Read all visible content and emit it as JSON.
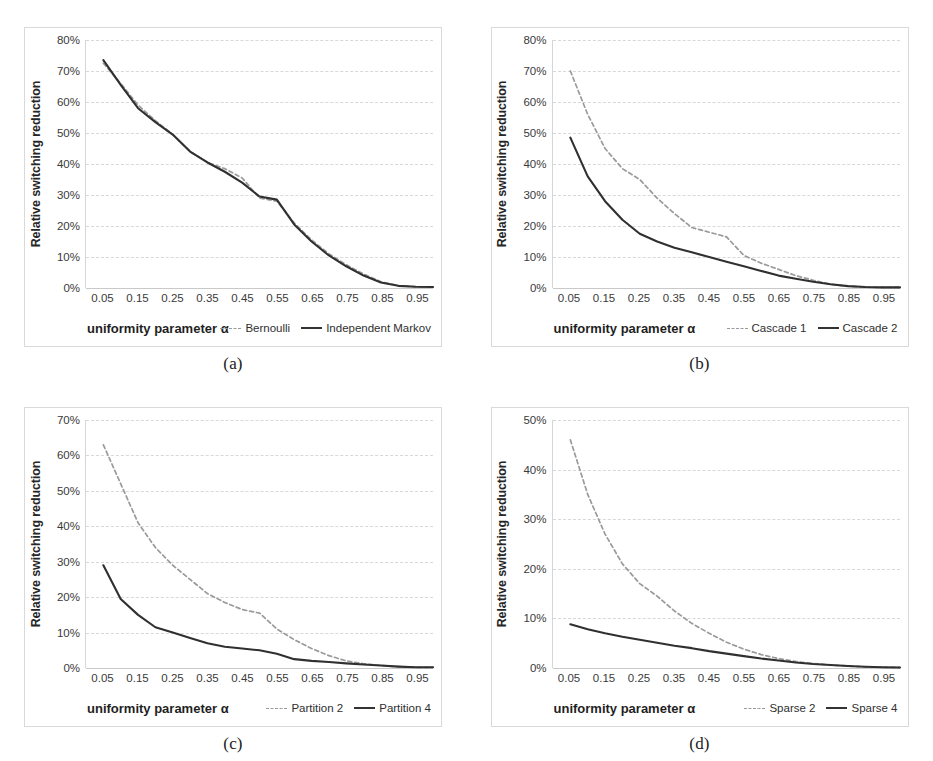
{
  "figure": {
    "panels": [
      {
        "caption": "(a)",
        "xlabel": "uniformity parameter α",
        "ylabel": "Relative switching reduction",
        "yticks": [
          "0%",
          "10%",
          "20%",
          "30%",
          "40%",
          "50%",
          "60%",
          "70%",
          "80%"
        ],
        "xticks": [
          "0.05",
          "0.15",
          "0.25",
          "0.35",
          "0.45",
          "0.55",
          "0.65",
          "0.75",
          "0.85",
          "0.95"
        ],
        "legend": [
          {
            "label": "Bernoulli",
            "style": "dashed"
          },
          {
            "label": "Independent Markov",
            "style": "solid"
          }
        ]
      },
      {
        "caption": "(b)",
        "xlabel": "uniformity parameter α",
        "ylabel": "Relative switching reduction",
        "yticks": [
          "0%",
          "10%",
          "20%",
          "30%",
          "40%",
          "50%",
          "60%",
          "70%",
          "80%"
        ],
        "xticks": [
          "0.05",
          "0.15",
          "0.25",
          "0.35",
          "0.45",
          "0.55",
          "0.65",
          "0.75",
          "0.85",
          "0.95"
        ],
        "legend": [
          {
            "label": "Cascade 1",
            "style": "dashed"
          },
          {
            "label": "Cascade 2",
            "style": "solid"
          }
        ]
      },
      {
        "caption": "(c)",
        "xlabel": "uniformity parameter α",
        "ylabel": "Relative switching reduction",
        "yticks": [
          "0%",
          "10%",
          "20%",
          "30%",
          "40%",
          "50%",
          "60%",
          "70%"
        ],
        "xticks": [
          "0.05",
          "0.15",
          "0.25",
          "0.35",
          "0.45",
          "0.55",
          "0.65",
          "0.75",
          "0.85",
          "0.95"
        ],
        "legend": [
          {
            "label": "Partition 2",
            "style": "dashed"
          },
          {
            "label": "Partition 4",
            "style": "solid"
          }
        ]
      },
      {
        "caption": "(d)",
        "xlabel": "uniformity parameter α",
        "ylabel": "Relative switching reduction",
        "yticks": [
          "0%",
          "10%",
          "20%",
          "30%",
          "40%",
          "50%"
        ],
        "xticks": [
          "0.05",
          "0.15",
          "0.25",
          "0.35",
          "0.45",
          "0.55",
          "0.65",
          "0.75",
          "0.85",
          "0.95"
        ],
        "legend": [
          {
            "label": "Sparse 2",
            "style": "dashed"
          },
          {
            "label": "Sparse 4",
            "style": "solid"
          }
        ]
      }
    ]
  },
  "chart_data": [
    {
      "type": "line",
      "title": "(a)",
      "xlabel": "uniformity parameter α",
      "ylabel": "Relative switching reduction",
      "xlim": [
        0.0,
        1.0
      ],
      "ylim": [
        0,
        80
      ],
      "yticks": [
        0,
        10,
        20,
        30,
        40,
        50,
        60,
        70,
        80
      ],
      "xticks": [
        0.05,
        0.15,
        0.25,
        0.35,
        0.45,
        0.55,
        0.65,
        0.75,
        0.85,
        0.95
      ],
      "grid": true,
      "legend_position": "bottom-right",
      "x": [
        0.05,
        0.1,
        0.15,
        0.2,
        0.25,
        0.3,
        0.35,
        0.4,
        0.45,
        0.5,
        0.55,
        0.6,
        0.65,
        0.7,
        0.75,
        0.8,
        0.85,
        0.9,
        0.95,
        1.0
      ],
      "series": [
        {
          "name": "Bernoulli",
          "style": "dashed",
          "values": [
            72.5,
            66.0,
            59.0,
            54.0,
            49.5,
            44.0,
            40.5,
            38.5,
            35.5,
            29.0,
            28.0,
            21.0,
            15.5,
            11.0,
            7.5,
            4.5,
            2.0,
            0.8,
            0.4,
            0.3
          ]
        },
        {
          "name": "Independent Markov",
          "style": "solid",
          "values": [
            73.5,
            65.5,
            58.0,
            53.5,
            49.5,
            44.0,
            40.5,
            37.5,
            34.0,
            29.5,
            28.5,
            20.5,
            15.0,
            10.5,
            7.0,
            4.0,
            1.8,
            0.7,
            0.4,
            0.3
          ]
        }
      ]
    },
    {
      "type": "line",
      "title": "(b)",
      "xlabel": "uniformity parameter α",
      "ylabel": "Relative switching reduction",
      "xlim": [
        0.0,
        1.0
      ],
      "ylim": [
        0,
        80
      ],
      "yticks": [
        0,
        10,
        20,
        30,
        40,
        50,
        60,
        70,
        80
      ],
      "xticks": [
        0.05,
        0.15,
        0.25,
        0.35,
        0.45,
        0.55,
        0.65,
        0.75,
        0.85,
        0.95
      ],
      "grid": true,
      "legend_position": "bottom-right",
      "x": [
        0.05,
        0.1,
        0.15,
        0.2,
        0.25,
        0.3,
        0.35,
        0.4,
        0.45,
        0.5,
        0.55,
        0.6,
        0.65,
        0.7,
        0.75,
        0.8,
        0.85,
        0.9,
        0.95,
        1.0
      ],
      "series": [
        {
          "name": "Cascade 1",
          "style": "dashed",
          "values": [
            70.0,
            56.0,
            45.0,
            38.5,
            35.0,
            29.0,
            24.0,
            19.5,
            18.0,
            16.5,
            10.5,
            8.0,
            6.0,
            4.0,
            2.5,
            1.2,
            0.6,
            0.3,
            0.2,
            0.2
          ]
        },
        {
          "name": "Cascade 2",
          "style": "solid",
          "values": [
            48.5,
            36.0,
            28.0,
            22.0,
            17.5,
            15.0,
            13.0,
            11.5,
            10.0,
            8.5,
            7.0,
            5.5,
            4.0,
            3.0,
            2.0,
            1.2,
            0.6,
            0.3,
            0.2,
            0.2
          ]
        }
      ]
    },
    {
      "type": "line",
      "title": "(c)",
      "xlabel": "uniformity parameter α",
      "ylabel": "Relative switching reduction",
      "xlim": [
        0.0,
        1.0
      ],
      "ylim": [
        0,
        70
      ],
      "yticks": [
        0,
        10,
        20,
        30,
        40,
        50,
        60,
        70
      ],
      "xticks": [
        0.05,
        0.15,
        0.25,
        0.35,
        0.45,
        0.55,
        0.65,
        0.75,
        0.85,
        0.95
      ],
      "grid": true,
      "legend_position": "bottom-right",
      "x": [
        0.05,
        0.1,
        0.15,
        0.2,
        0.25,
        0.3,
        0.35,
        0.4,
        0.45,
        0.5,
        0.55,
        0.6,
        0.65,
        0.7,
        0.75,
        0.8,
        0.85,
        0.9,
        0.95,
        1.0
      ],
      "series": [
        {
          "name": "Partition 2",
          "style": "dashed",
          "values": [
            63.0,
            52.0,
            41.0,
            34.0,
            29.0,
            25.0,
            21.0,
            18.5,
            16.5,
            15.5,
            11.0,
            8.0,
            5.5,
            3.5,
            2.0,
            1.2,
            0.7,
            0.4,
            0.2,
            0.2
          ]
        },
        {
          "name": "Partition 4",
          "style": "solid",
          "values": [
            29.0,
            19.5,
            15.0,
            11.5,
            10.0,
            8.5,
            7.0,
            6.0,
            5.5,
            5.0,
            4.0,
            2.5,
            2.0,
            1.7,
            1.3,
            1.0,
            0.7,
            0.4,
            0.2,
            0.2
          ]
        }
      ]
    },
    {
      "type": "line",
      "title": "(d)",
      "xlabel": "uniformity parameter α",
      "ylabel": "Relative switching reduction",
      "xlim": [
        0.0,
        1.0
      ],
      "ylim": [
        0,
        50
      ],
      "yticks": [
        0,
        10,
        20,
        30,
        40,
        50
      ],
      "xticks": [
        0.05,
        0.15,
        0.25,
        0.35,
        0.45,
        0.55,
        0.65,
        0.75,
        0.85,
        0.95
      ],
      "grid": true,
      "legend_position": "bottom-right",
      "x": [
        0.05,
        0.1,
        0.15,
        0.2,
        0.25,
        0.3,
        0.35,
        0.4,
        0.45,
        0.5,
        0.55,
        0.6,
        0.65,
        0.7,
        0.75,
        0.8,
        0.85,
        0.9,
        0.95,
        1.0
      ],
      "series": [
        {
          "name": "Sparse 2",
          "style": "dashed",
          "values": [
            46.0,
            35.0,
            27.0,
            21.0,
            17.0,
            14.5,
            11.5,
            9.0,
            7.0,
            5.2,
            3.8,
            2.7,
            1.9,
            1.3,
            0.9,
            0.6,
            0.4,
            0.2,
            0.15,
            0.1
          ]
        },
        {
          "name": "Sparse 4",
          "style": "solid",
          "values": [
            8.8,
            7.8,
            7.0,
            6.3,
            5.7,
            5.1,
            4.5,
            4.0,
            3.4,
            2.9,
            2.4,
            1.9,
            1.5,
            1.1,
            0.8,
            0.6,
            0.4,
            0.25,
            0.15,
            0.1
          ]
        }
      ]
    }
  ]
}
